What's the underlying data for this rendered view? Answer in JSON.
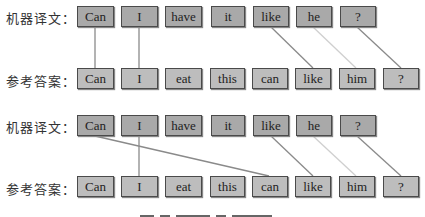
{
  "diagram": {
    "panels": [
      {
        "machine_label": "机器译文：",
        "reference_label": "参考答案：",
        "machine_tokens": [
          "Can",
          "I",
          "have",
          "it",
          "like",
          "he",
          "?"
        ],
        "reference_tokens": [
          "Can",
          "I",
          "eat",
          "this",
          "can",
          "like",
          "him",
          "?"
        ],
        "alignments": [
          {
            "from": "Can",
            "to": "Can"
          },
          {
            "from": "I",
            "to": "I"
          },
          {
            "from": "like",
            "to": "like"
          },
          {
            "from": "he",
            "to": "him",
            "style": "light"
          },
          {
            "from": "?",
            "to": "?"
          }
        ]
      },
      {
        "machine_label": "机器译文：",
        "reference_label": "参考答案：",
        "machine_tokens": [
          "Can",
          "I",
          "have",
          "it",
          "like",
          "he",
          "?"
        ],
        "reference_tokens": [
          "Can",
          "I",
          "eat",
          "this",
          "can",
          "like",
          "him",
          "?"
        ],
        "alignments": [
          {
            "from": "Can",
            "to": "can"
          },
          {
            "from": "I",
            "to": "I"
          },
          {
            "from": "like",
            "to": "like"
          },
          {
            "from": "he",
            "to": "him",
            "style": "light"
          },
          {
            "from": "?",
            "to": "?"
          }
        ]
      }
    ],
    "colors": {
      "machine_box": "#a9a9a9",
      "reference_box": "#bdbdbd",
      "border": "#4a4a4a",
      "link": "#8a8a8a",
      "link_light": "#cfcfcf"
    }
  }
}
